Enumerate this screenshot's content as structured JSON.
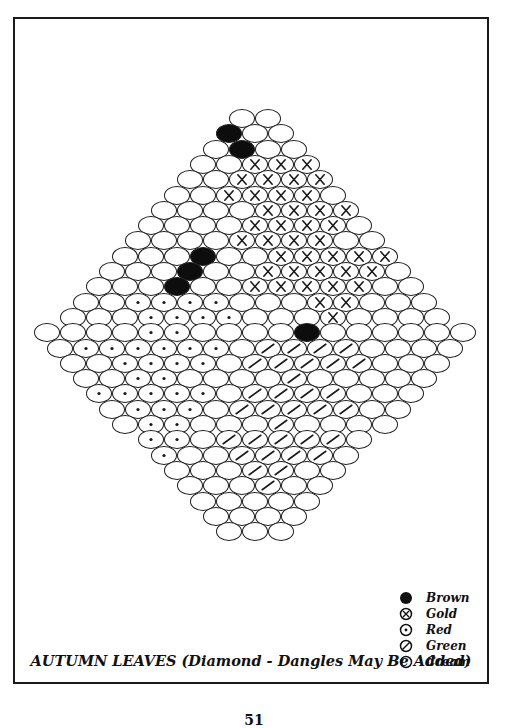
{
  "title": "AUTUMN LEAVES (Diamond - Dangles May Be Added)",
  "page_number": "51",
  "legend": [
    {
      "key": "B",
      "label": "Brown",
      "symbol": "filled-circle-icon"
    },
    {
      "key": "G",
      "label": "Gold",
      "symbol": "circle-x-icon"
    },
    {
      "key": "R",
      "label": "Red",
      "symbol": "circle-dot-icon"
    },
    {
      "key": "N",
      "label": "Green",
      "symbol": "circle-slash-icon"
    },
    {
      "key": "C",
      "label": "Cream",
      "symbol": "empty-circle-icon"
    }
  ],
  "colors": {
    "ink": "#111111",
    "paper": "#ffffff"
  },
  "grid": {
    "bead_width": 26,
    "bead_height": 19,
    "row_spacing": 15.3,
    "center_x": 255,
    "top_y": 109,
    "rows": [
      "CC",
      "BCC",
      "CBCC",
      "CCGGG",
      "CCGGGG",
      "CCGGGGC",
      "CCCCGGGG",
      "CCCCGGGGC",
      "CCCCGGGGCC",
      "CCCBCCGGGGG",
      "CCCBCCGGGGGC",
      "CCCBCCGGGGGCC",
      "CCRRRRCCCGGCCC",
      "CCCRRRRCCCGCCCC",
      "CCCCRRCCCCBCCCCCC",
      "CRRRRRRCNNNNCCCC",
      "CCRRRRCNNNNNCCC",
      "CCRRCCCCNCCCCC",
      "RRRRRCNNNNCCC",
      "CRRRCNNNNNCC",
      "CRRCCCNCCCC",
      "RRCNNNNNC",
      "RCCNNNNC",
      "CCCNNCC",
      "CCCNCC",
      "CCCCC",
      "CCCC",
      "CCC"
    ]
  }
}
